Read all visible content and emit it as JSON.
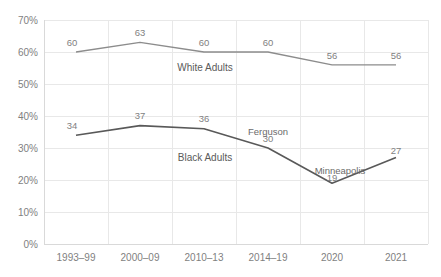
{
  "chart_data": {
    "type": "line",
    "title": "",
    "subtitle": "",
    "xlabel": "",
    "ylabel": "",
    "ylim": [
      0,
      70
    ],
    "yticks": [
      "0%",
      "10%",
      "20%",
      "30%",
      "40%",
      "50%",
      "60%",
      "70%"
    ],
    "ytick_values": [
      0,
      10,
      20,
      30,
      40,
      50,
      60,
      70
    ],
    "grid": true,
    "legend_position": "inline-labels",
    "categories": [
      "1993–99",
      "2000–09",
      "2010–13",
      "2014–19",
      "2020",
      "2021"
    ],
    "series": [
      {
        "name": "White Adults",
        "color": "#8c8c8c",
        "values": [
          60,
          63,
          60,
          60,
          56,
          56
        ],
        "value_labels": [
          "60",
          "63",
          "60",
          "60",
          "56",
          "56"
        ],
        "inline_label": "White Adults"
      },
      {
        "name": "Black Adults",
        "color": "#595959",
        "values": [
          34,
          37,
          36,
          30,
          19,
          27
        ],
        "value_labels": [
          "34",
          "37",
          "36",
          "30",
          "19",
          "27"
        ],
        "inline_label": "Black Adults"
      }
    ],
    "annotations": [
      {
        "text": "Ferguson",
        "category": "2014–19",
        "series": "Black Adults",
        "value": 30
      },
      {
        "text": "Minneapolis",
        "category": "2020",
        "series": "Black Adults",
        "value": 19
      }
    ]
  },
  "colors": {
    "white_adults_line": "#8c8c8c",
    "black_adults_line": "#595959",
    "gridline": "#e8e8e8",
    "axis": "#d9d9d9",
    "tick_text": "#7f7f7f",
    "background": "#ffffff"
  }
}
